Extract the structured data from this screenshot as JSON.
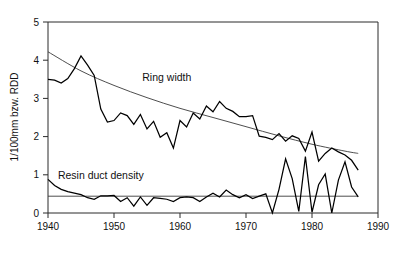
{
  "chart_data": {
    "type": "line",
    "title": "",
    "xlabel": "",
    "ylabel": "1/100mm bzw. RDD",
    "xlim": [
      1940,
      1990
    ],
    "ylim": [
      0,
      5
    ],
    "xticks": [
      1940,
      1950,
      1960,
      1970,
      1980,
      1990
    ],
    "yticks": [
      0,
      1,
      2,
      3,
      4,
      5
    ],
    "grid": false,
    "legend_position": "inline-annotations",
    "annotations": [
      {
        "text": "Ring width",
        "x": 1958,
        "y": 3.45
      },
      {
        "text": "Resin duct density",
        "x": 1948,
        "y": 0.88
      }
    ],
    "x": [
      1940,
      1941,
      1942,
      1943,
      1944,
      1945,
      1946,
      1947,
      1948,
      1949,
      1950,
      1951,
      1952,
      1953,
      1954,
      1955,
      1956,
      1957,
      1958,
      1959,
      1960,
      1961,
      1962,
      1963,
      1964,
      1965,
      1966,
      1967,
      1968,
      1969,
      1970,
      1971,
      1972,
      1973,
      1974,
      1975,
      1976,
      1977,
      1978,
      1979,
      1980,
      1981,
      1982,
      1983,
      1984,
      1985,
      1986,
      1987
    ],
    "series": [
      {
        "name": "Ring width",
        "units": "1/100mm",
        "values": [
          3.5,
          3.48,
          3.4,
          3.52,
          3.78,
          4.11,
          3.87,
          3.6,
          2.72,
          2.38,
          2.42,
          2.62,
          2.55,
          2.32,
          2.58,
          2.2,
          2.4,
          1.98,
          2.1,
          1.7,
          2.42,
          2.25,
          2.62,
          2.46,
          2.8,
          2.65,
          2.92,
          2.74,
          2.66,
          2.52,
          2.52,
          2.55,
          2.01,
          1.98,
          1.92,
          2.08,
          1.88,
          2.02,
          1.95,
          1.62,
          2.12,
          1.36,
          1.56,
          1.7,
          1.6,
          1.52,
          1.38,
          1.12
        ]
      },
      {
        "name": "Resin duct density",
        "units": "RDD",
        "values": [
          0.88,
          0.72,
          0.62,
          0.56,
          0.52,
          0.48,
          0.4,
          0.36,
          0.45,
          0.45,
          0.46,
          0.3,
          0.4,
          0.18,
          0.42,
          0.2,
          0.4,
          0.38,
          0.36,
          0.3,
          0.4,
          0.42,
          0.4,
          0.3,
          0.42,
          0.52,
          0.42,
          0.6,
          0.48,
          0.4,
          0.48,
          0.38,
          0.44,
          0.5,
          0.0,
          0.62,
          1.42,
          0.9,
          0.04,
          1.48,
          0.02,
          0.74,
          1.02,
          0.0,
          0.86,
          1.34,
          0.68,
          0.42
        ]
      }
    ],
    "trend_lines": [
      {
        "name": "Ring width trend",
        "for_series": "Ring width",
        "points": [
          [
            1940,
            4.22
          ],
          [
            1945,
            3.72
          ],
          [
            1950,
            3.34
          ],
          [
            1955,
            3.02
          ],
          [
            1960,
            2.74
          ],
          [
            1965,
            2.5
          ],
          [
            1970,
            2.26
          ],
          [
            1975,
            2.02
          ],
          [
            1980,
            1.8
          ],
          [
            1985,
            1.62
          ],
          [
            1987,
            1.56
          ]
        ]
      },
      {
        "name": "Resin duct density mean",
        "for_series": "Resin duct density",
        "points": [
          [
            1940,
            0.44
          ],
          [
            1987,
            0.44
          ]
        ]
      }
    ]
  }
}
